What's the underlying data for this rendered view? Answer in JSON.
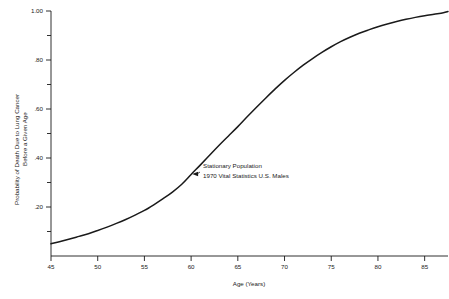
{
  "chart_data": {
    "type": "line",
    "title": "",
    "subtitle": "",
    "xlabel": "Age (Years)",
    "ylabel": "Probability of Death Due to Lung Cancer\nBefore a Given Age",
    "ylabel_line1": "Probability of Death Due to Lung Cancer",
    "ylabel_line2": "Before a Given Age",
    "xlim": [
      45,
      87.5
    ],
    "ylim": [
      0.0,
      1.0
    ],
    "grid": false,
    "legend": "none",
    "xticks": [
      45,
      50,
      55,
      60,
      65,
      70,
      75,
      80,
      85
    ],
    "xticklabels": [
      "45",
      "50",
      "55",
      "60",
      "65",
      "70",
      "75",
      "80",
      "85"
    ],
    "yticks_major": [
      0.2,
      0.4,
      0.6,
      0.8,
      1.0
    ],
    "yticklabels": [
      ".20",
      ".40",
      ".60",
      ".80",
      "1.00"
    ],
    "yticks_minor": [
      0.1,
      0.3,
      0.5,
      0.7,
      0.9
    ],
    "annotation": {
      "line1": "Stationary Population",
      "line2": "1970 Vital Statistics U.S. Males",
      "points_to_x": 60.0,
      "points_to_y": 0.335
    },
    "series": [
      {
        "name": "Stationary Population 1970 Vital Statistics U.S. Males",
        "color": "#1a1a1a",
        "x": [
          45,
          46,
          47,
          48,
          49,
          50,
          51,
          52,
          53,
          54,
          55,
          56,
          57,
          58,
          59,
          60,
          61,
          62,
          63,
          64,
          65,
          66,
          67,
          68,
          69,
          70,
          71,
          72,
          73,
          74,
          75,
          76,
          77,
          78,
          79,
          80,
          81,
          82,
          83,
          84,
          85,
          86,
          87,
          87.5
        ],
        "y": [
          0.05,
          0.059,
          0.069,
          0.08,
          0.091,
          0.104,
          0.118,
          0.133,
          0.149,
          0.167,
          0.186,
          0.209,
          0.234,
          0.261,
          0.293,
          0.333,
          0.372,
          0.412,
          0.452,
          0.49,
          0.528,
          0.568,
          0.607,
          0.645,
          0.682,
          0.717,
          0.749,
          0.779,
          0.806,
          0.831,
          0.854,
          0.875,
          0.893,
          0.909,
          0.923,
          0.936,
          0.947,
          0.957,
          0.966,
          0.974,
          0.981,
          0.987,
          0.993,
          0.998
        ]
      }
    ]
  },
  "axes": {
    "x_axis_name": "Age (Years)",
    "y_axis_name": "Probability of Death Due to Lung Cancer Before a Given Age"
  }
}
